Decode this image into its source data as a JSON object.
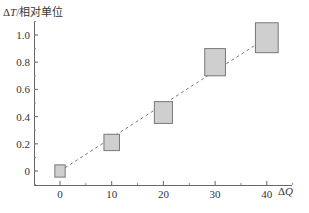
{
  "chart_data": {
    "type": "scatter",
    "title": "",
    "xlabel": "ΔQ",
    "ylabel": "ΔT/相对单位",
    "x_ticks": [
      "0",
      "10",
      "20",
      "30",
      "40"
    ],
    "y_ticks": [
      "0",
      "0.2",
      "0.4",
      "0.6",
      "0.8",
      "1.0"
    ],
    "xlim": [
      -5,
      45
    ],
    "ylim": [
      -0.1,
      1.1
    ],
    "grid": false,
    "legend": null,
    "series": [
      {
        "name": "measurements (error boxes)",
        "points": [
          {
            "x": 0,
            "y": 0.0,
            "x_err": 1.0,
            "y_err": 0.045
          },
          {
            "x": 10,
            "y": 0.21,
            "x_err": 1.5,
            "y_err": 0.06
          },
          {
            "x": 20,
            "y": 0.43,
            "x_err": 1.75,
            "y_err": 0.08
          },
          {
            "x": 30,
            "y": 0.8,
            "x_err": 2.0,
            "y_err": 0.1
          },
          {
            "x": 40,
            "y": 0.98,
            "x_err": 2.2,
            "y_err": 0.11
          }
        ]
      },
      {
        "name": "linear fit (dashed)",
        "x": [
          0,
          40
        ],
        "y": [
          0.0,
          0.98
        ]
      }
    ]
  }
}
